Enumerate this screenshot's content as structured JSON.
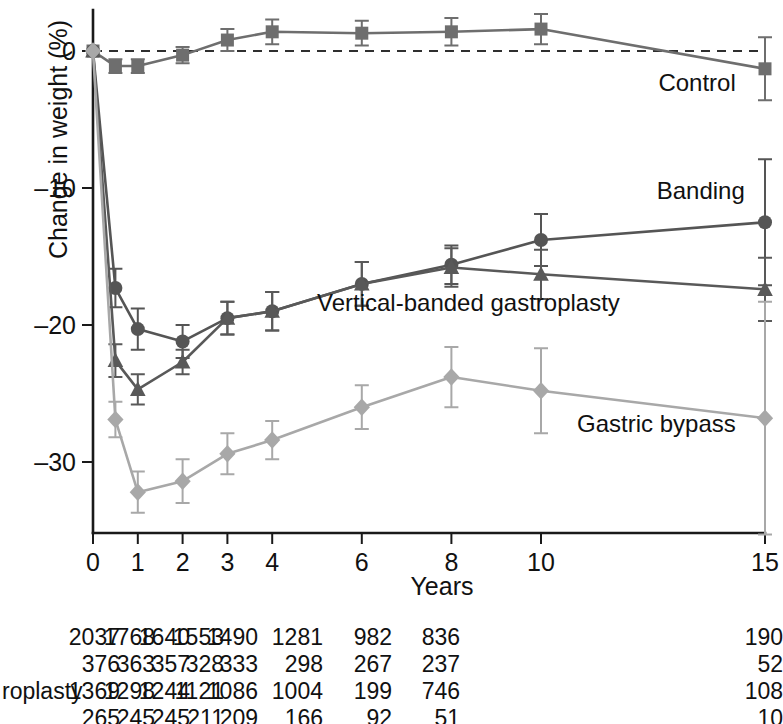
{
  "chart_data": {
    "type": "line",
    "title": "",
    "xlabel": "Years",
    "ylabel": "Change in weight (%)",
    "xticks": [
      0,
      1,
      2,
      3,
      4,
      6,
      8,
      10,
      15
    ],
    "xtick_labels": [
      "0",
      "1",
      "2",
      "3",
      "4",
      "6",
      "8",
      "10",
      "15"
    ],
    "yticks": [
      0,
      -10,
      -20,
      -30
    ],
    "ytick_labels": [
      "0",
      "–10",
      "–20",
      "–30"
    ],
    "xlim": [
      0,
      15
    ],
    "ylim": [
      -36,
      3
    ],
    "grid": false,
    "legend_position": "inline-right",
    "zero_reference_line": true,
    "series": [
      {
        "name": "Control",
        "color": "#6e6e6e",
        "marker": "square",
        "label_x": 11.0,
        "label_y": -2.3,
        "x": [
          0,
          0.5,
          1,
          2,
          3,
          4,
          6,
          8,
          10,
          15
        ],
        "y": [
          0,
          -1.1,
          -1.1,
          -0.3,
          0.8,
          1.4,
          1.3,
          1.4,
          1.6,
          -1.3
        ],
        "err": [
          0,
          0.5,
          0.5,
          0.6,
          0.8,
          0.9,
          0.9,
          1.0,
          1.1,
          2.3
        ]
      },
      {
        "name": "Banding",
        "color": "#555555",
        "marker": "circle",
        "label_x": 11.2,
        "label_y": -10.2,
        "x": [
          0,
          0.5,
          1,
          2,
          3,
          4,
          6,
          8,
          10,
          15
        ],
        "y": [
          0,
          -17.3,
          -20.3,
          -21.2,
          -19.5,
          -19.0,
          -17.0,
          -15.6,
          -13.8,
          -12.5
        ],
        "err": [
          0,
          1.4,
          1.5,
          1.2,
          1.2,
          1.4,
          1.6,
          1.4,
          1.9,
          4.6
        ]
      },
      {
        "name": "Vertical-banded gastroplasty",
        "color": "#595959",
        "marker": "triangle",
        "label_x": 5.0,
        "label_y": -18.4,
        "x": [
          0,
          0.5,
          1,
          2,
          3,
          4,
          6,
          8,
          10,
          15
        ],
        "y": [
          0,
          -22.6,
          -24.7,
          -22.7,
          -19.5,
          -19.0,
          -17.0,
          -15.8,
          -16.3,
          -17.4
        ],
        "err": [
          0,
          1.2,
          1.1,
          0.9,
          1.2,
          1.4,
          1.6,
          1.4,
          1.8,
          2.3
        ]
      },
      {
        "name": "Gastric bypass",
        "color": "#a8a8a8",
        "marker": "diamond",
        "label_x": 11.0,
        "label_y": -27.2,
        "x": [
          0,
          0.5,
          1,
          2,
          3,
          4,
          6,
          8,
          10,
          15
        ],
        "y": [
          0,
          -26.9,
          -32.2,
          -31.4,
          -29.4,
          -28.4,
          -26.0,
          -23.8,
          -24.8,
          -26.8
        ],
        "err": [
          0,
          1.3,
          1.5,
          1.6,
          1.5,
          1.4,
          1.6,
          2.2,
          3.1,
          8.5
        ]
      }
    ]
  },
  "table": {
    "row_label_visible": "roplasty",
    "columns": [
      "0",
      "1",
      "2",
      "3",
      "4",
      "6",
      "8",
      "10",
      "15"
    ],
    "rows": [
      {
        "label": "",
        "values": [
          "2037",
          "1768",
          "1640",
          "1553",
          "1490",
          "1281",
          "982",
          "836",
          "190"
        ]
      },
      {
        "label": "",
        "values": [
          "376",
          "363",
          "357",
          "328",
          "333",
          "298",
          "267",
          "237",
          "52"
        ]
      },
      {
        "label": "roplasty",
        "values": [
          "1369",
          "1298",
          "1244",
          "1121",
          "1086",
          "1004",
          "199",
          "746",
          "108"
        ]
      },
      {
        "label": "",
        "values": [
          "265",
          "245",
          "245",
          "211",
          "209",
          "166",
          "92",
          "51",
          "10"
        ]
      }
    ]
  }
}
